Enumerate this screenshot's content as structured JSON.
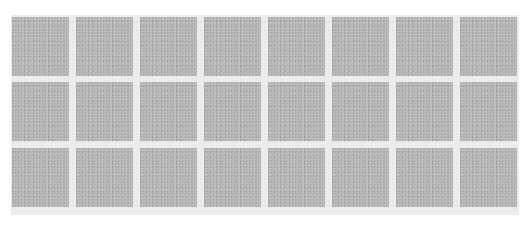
{
  "grid": {
    "rows": 3,
    "columns": 8,
    "tile_color": "#b9b9b9",
    "gap_color": "#ececec",
    "background": "#ffffff",
    "tile_texture": "gray-noise"
  }
}
